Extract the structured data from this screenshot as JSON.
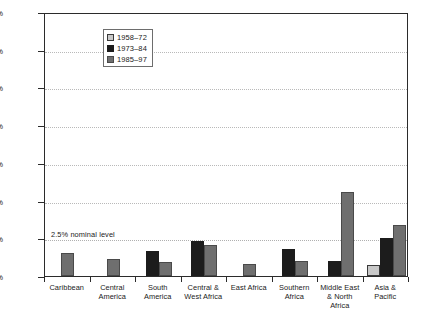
{
  "chart_data": {
    "type": "bar",
    "title": "",
    "xlabel": "",
    "ylabel": "",
    "ylim": [
      0,
      17.5
    ],
    "ytick_labels": [
      "0.0%",
      "2.5%",
      "5.0%",
      "7.5%",
      "10.0%",
      "12.5%",
      "15.0%",
      "17.5%"
    ],
    "ytick_values": [
      0,
      2.5,
      5.0,
      7.5,
      10.0,
      12.5,
      15.0,
      17.5
    ],
    "grid": true,
    "legend_position": "upper-left-inside",
    "categories": [
      "Caribbean",
      "Central America",
      "South America",
      "Central & West Africa",
      "East Africa",
      "Southern Africa",
      "Middle East & North Africa",
      "Asia & Pacific"
    ],
    "category_lines": [
      [
        "Caribbean"
      ],
      [
        "Central",
        "America"
      ],
      [
        "South",
        "America"
      ],
      [
        "Central &",
        "West Africa"
      ],
      [
        "East Africa"
      ],
      [
        "Southern",
        "Africa"
      ],
      [
        "Middle East",
        "& North",
        "Africa"
      ],
      [
        "Asia &",
        "Pacific"
      ]
    ],
    "series": [
      {
        "name": "1958–72",
        "color": "#c9c9c9",
        "values": [
          null,
          null,
          null,
          null,
          null,
          null,
          null,
          0.7
        ]
      },
      {
        "name": "1973–84",
        "color": "#1c1c1c",
        "values": [
          null,
          null,
          1.65,
          2.35,
          null,
          1.8,
          1.0,
          2.5
        ]
      },
      {
        "name": "1985–97",
        "color": "#6f6f6f",
        "values": [
          1.5,
          1.1,
          0.9,
          2.05,
          0.8,
          1.0,
          5.6,
          3.4
        ]
      }
    ],
    "annotations": [
      {
        "text": "2.5% nominal level",
        "value": 2.5
      }
    ]
  }
}
